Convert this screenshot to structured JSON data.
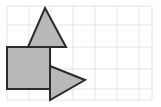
{
  "canvas": {
    "width": 161,
    "height": 107,
    "background_color": "#ffffff"
  },
  "grid": {
    "name": "graph-paper-grid",
    "line_color": "#e3e3e3",
    "line_width": 1,
    "cell_size": 22,
    "origin_x": 7,
    "origin_y": 6,
    "columns": 7,
    "rows": 4,
    "right_edge": 152,
    "bottom_edge": 100,
    "vertical_lines": [
      7,
      29,
      51,
      73,
      95,
      117,
      139,
      152
    ],
    "horizontal_lines": [
      6,
      25,
      47,
      69,
      89,
      100
    ]
  },
  "shapes": {
    "fill_color": "#b8b8b8",
    "stroke_color": "#2b2b2b",
    "stroke_width": 2,
    "items": [
      {
        "id": "square",
        "label": "Square",
        "kind": "rectangle",
        "x": 7,
        "y": 47,
        "width": 43,
        "height": 42,
        "points": "7,47 50,47 50,89 7,89"
      },
      {
        "id": "triangle-up",
        "label": "Upward Triangle",
        "kind": "triangle",
        "direction": "up",
        "apex_x": 45,
        "apex_y": 8,
        "base_left_x": 28,
        "base_right_x": 66,
        "base_y": 47,
        "points": "45,8 66,47 28,47"
      },
      {
        "id": "triangle-right",
        "label": "Rightward Triangle",
        "kind": "triangle",
        "direction": "right",
        "tip_x": 85,
        "tip_y": 80,
        "edge_x": 50,
        "edge_top_y": 66,
        "edge_bottom_y": 100,
        "points": "50,66 85,80 50,100"
      }
    ]
  }
}
